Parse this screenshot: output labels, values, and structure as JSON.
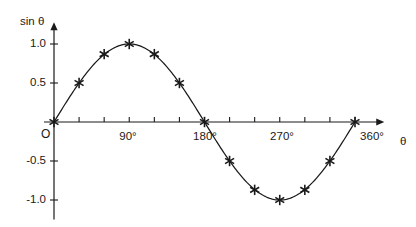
{
  "chart_data": {
    "type": "line",
    "title": "",
    "subtitle": "",
    "xlabel": "θ",
    "ylabel": "sin θ",
    "origin_label": "O",
    "x": [
      0,
      30,
      60,
      90,
      120,
      150,
      180,
      210,
      240,
      270,
      300,
      330,
      360
    ],
    "values": [
      0.0,
      0.5,
      0.87,
      1.0,
      0.87,
      0.5,
      0.0,
      -0.5,
      -0.87,
      -1.0,
      -0.87,
      -0.5,
      0.0
    ],
    "series": [
      {
        "name": "sin θ",
        "values": [
          0.0,
          0.5,
          0.87,
          1.0,
          0.87,
          0.5,
          0.0,
          -0.5,
          -0.87,
          -1.0,
          -0.87,
          -0.5,
          0.0
        ]
      }
    ],
    "xlim": [
      0,
      395
    ],
    "ylim": [
      -1.25,
      1.28
    ],
    "x_major_ticks": [
      0,
      90,
      180,
      270,
      360
    ],
    "x_major_tick_labels": [
      "",
      "90°",
      "180°",
      "270°",
      "360°"
    ],
    "x_minor_ticks": [
      30,
      60,
      120,
      150,
      210,
      240,
      300,
      330
    ],
    "y_ticks": [
      1.0,
      0.5,
      -0.5,
      -1.0
    ],
    "y_tick_labels": [
      "1.0",
      "0.5",
      "-0.5",
      "-1.0"
    ],
    "grid": false,
    "legend": false,
    "legend_position": "none",
    "marker": "asterisk",
    "line_color": "#1a1a1a",
    "axis_color": "#1a1a1a",
    "marker_color": "#1a1a1a",
    "background_color": "#ffffff",
    "x_axis_arrow": true,
    "y_axis_arrow": true,
    "annotations": []
  }
}
